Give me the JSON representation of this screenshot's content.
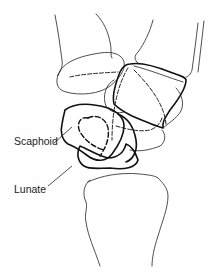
{
  "figure": {
    "labels": [
      {
        "id": "scaphoid",
        "text": "Scaphoid"
      },
      {
        "id": "lunate",
        "text": "Lunate"
      }
    ],
    "colors": {
      "line": "#111111",
      "background": "#ffffff"
    }
  }
}
